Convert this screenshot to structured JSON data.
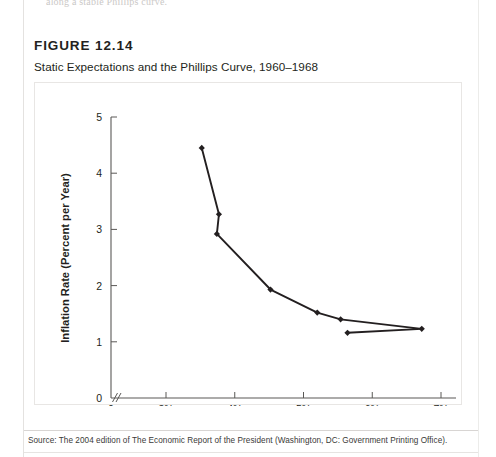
{
  "page": {
    "bleed_text": "along a stable Phillips curve.",
    "background": "#ffffff"
  },
  "figure": {
    "label": "FIGURE 12.14",
    "subtitle": "Static Expectations and the Phillips Curve, 1960–1968",
    "source": "Source: The 2004 edition of The Economic Report of the President (Washington, DC: Government Printing Office).",
    "frame_color": "#e8e6e4"
  },
  "chart_data": {
    "type": "line",
    "title": "Static Expectations and the Phillips Curve, 1960–1968",
    "xlabel": "Unemployment Rate",
    "ylabel": "Inflation Rate (Percent per Year)",
    "xlim": [
      2.6,
      7.0
    ],
    "ylim": [
      0,
      5
    ],
    "x_ticks": [
      3,
      4,
      5,
      6,
      7
    ],
    "x_tick_labels": [
      "3%",
      "4%",
      "5%",
      "6%",
      "7%"
    ],
    "y_ticks": [
      0,
      1,
      2,
      3,
      4,
      5
    ],
    "y_tick_labels": [
      "0",
      "1",
      "2",
      "3",
      "4",
      "5"
    ],
    "origin_label": "0",
    "axis_break": true,
    "axis_break_glyph": "//",
    "grid": false,
    "legend": null,
    "marker": "diamond",
    "line_color": "#231f20",
    "marker_color": "#231f20",
    "points": [
      {
        "x": 3.52,
        "y": 4.45
      },
      {
        "x": 3.77,
        "y": 3.27
      },
      {
        "x": 3.74,
        "y": 2.92
      },
      {
        "x": 4.52,
        "y": 1.93
      },
      {
        "x": 5.2,
        "y": 1.52
      },
      {
        "x": 5.54,
        "y": 1.4
      },
      {
        "x": 6.72,
        "y": 1.23
      },
      {
        "x": 5.64,
        "y": 1.16
      }
    ],
    "series": [
      {
        "name": "Phillips curve 1960–1968",
        "x": [
          3.52,
          3.77,
          3.74,
          4.52,
          5.2,
          5.54,
          6.72,
          5.64
        ],
        "values": [
          4.45,
          3.27,
          2.92,
          1.93,
          1.52,
          1.4,
          1.23,
          1.16
        ]
      }
    ]
  }
}
